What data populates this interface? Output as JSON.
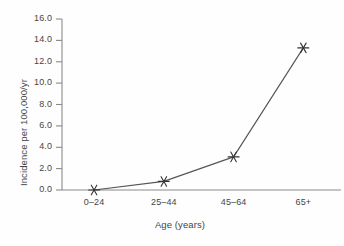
{
  "chart_data": {
    "type": "line",
    "title": "",
    "subtitle": "",
    "xlabel": "Age (years)",
    "ylabel": "Incidence per 100,000/yr",
    "categories": [
      "0–24",
      "25–44",
      "45–64",
      "65+"
    ],
    "values": [
      0.0,
      0.8,
      3.1,
      13.3
    ],
    "series": [
      {
        "name": "Incidence",
        "values": [
          0.0,
          0.8,
          3.1,
          13.3
        ]
      }
    ],
    "ylim": [
      0.0,
      16.0
    ],
    "ytick_labels": [
      "0.0",
      "2.0",
      "4.0",
      "6.0",
      "8.0",
      "10.0",
      "12.0",
      "14.0",
      "16.0"
    ],
    "ytick_values": [
      0.0,
      2.0,
      4.0,
      6.0,
      8.0,
      10.0,
      12.0,
      14.0,
      16.0
    ],
    "xtick_labels": [
      "0–24",
      "25–44",
      "45–64",
      "65+"
    ],
    "grid": false,
    "legend": false,
    "legend_position": "none",
    "marker": "asterisk",
    "line_color": "#555555",
    "marker_color": "#333333",
    "axis_color": "#8a8a8a",
    "text_color": "#464646",
    "background_color": "#fefefe"
  }
}
